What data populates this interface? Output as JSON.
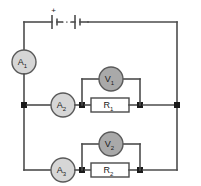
{
  "diagram": {
    "colors": {
      "wire": "#4d4d4d",
      "node": "#1a1a1a",
      "ammeter_fill": "#d6d6d6",
      "voltmeter_fill": "#a9a9a9",
      "resistor_fill": "#ffffff",
      "component_stroke": "#5a5a5a",
      "background": "#ffffff",
      "text": "#1a1a1a"
    },
    "battery": {
      "name": "battery",
      "polarity_label": "+",
      "ellipsis": "...",
      "cell_count_shown": 2
    },
    "ammeters": [
      {
        "id": "A1",
        "base": "A",
        "sub": "1"
      },
      {
        "id": "A2",
        "base": "A",
        "sub": "2"
      },
      {
        "id": "A3",
        "base": "A",
        "sub": "3"
      }
    ],
    "voltmeters": [
      {
        "id": "V1",
        "base": "V",
        "sub": "1"
      },
      {
        "id": "V2",
        "base": "V",
        "sub": "2"
      }
    ],
    "resistors": [
      {
        "id": "R1",
        "base": "R",
        "sub": "1"
      },
      {
        "id": "R2",
        "base": "R",
        "sub": "2"
      }
    ]
  }
}
